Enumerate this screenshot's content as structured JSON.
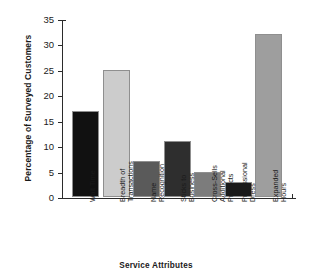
{
  "chart_data": {
    "type": "bar",
    "title": "",
    "xlabel": "Service Attributes",
    "ylabel": "Percentage of Surveyed Customers",
    "categories": [
      "Wait Time",
      "Breadth of\nTransactions",
      "Name\nRecognition",
      "Sticks to\nBusiness",
      "Cross-Sells\nAdditional\nProducts",
      "Professional\nDress",
      "Expanded\nHours"
    ],
    "values": [
      17,
      25,
      7,
      11,
      5,
      3,
      32
    ],
    "bar_colors": [
      "#111111",
      "#cccccc",
      "#5a5a5a",
      "#2e2e2e",
      "#7c7c7c",
      "#1a1a1a",
      "#9e9e9e"
    ],
    "ylim": [
      0,
      35
    ],
    "ytick_labels": [
      "0",
      "5",
      "10",
      "15",
      "20",
      "25",
      "30",
      "35"
    ],
    "ytick_values": [
      0,
      5,
      10,
      15,
      20,
      25,
      30,
      35
    ],
    "grid": false,
    "legend": false
  }
}
